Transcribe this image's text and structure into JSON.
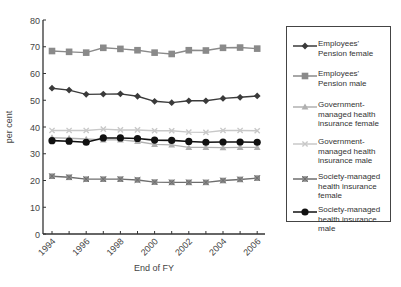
{
  "chart_data": {
    "type": "line",
    "title": "",
    "xlabel": "End of FY",
    "ylabel": "per cent",
    "ylim": [
      0,
      80
    ],
    "yticks": [
      0,
      10,
      20,
      30,
      40,
      50,
      60,
      70,
      80
    ],
    "x": [
      1994,
      1995,
      1996,
      1997,
      1998,
      1999,
      2000,
      2001,
      2002,
      2003,
      2004,
      2005,
      2006
    ],
    "xtick_labels": [
      "1994",
      "1996",
      "1998",
      "2000",
      "2002",
      "2004",
      "2006"
    ],
    "grid": false,
    "legend_position": "right",
    "series": [
      {
        "name": "Employees' Pension female",
        "marker": "diamond",
        "color": "#3a3a3a",
        "values": [
          54.5,
          53.8,
          52.2,
          52.3,
          52.4,
          51.5,
          49.6,
          49.1,
          49.8,
          49.8,
          50.7,
          51.1,
          51.6
        ]
      },
      {
        "name": "Employees' Pension male",
        "marker": "square",
        "color": "#8a8a8a",
        "values": [
          68.4,
          68.1,
          67.8,
          69.6,
          69.2,
          68.7,
          67.8,
          67.3,
          68.7,
          68.6,
          69.6,
          69.7,
          69.3
        ]
      },
      {
        "name": "Government-managed health insurance female",
        "marker": "triangle",
        "color": "#b0b0b0",
        "values": [
          36.0,
          35.8,
          35.5,
          35.2,
          35.2,
          34.6,
          33.5,
          33.3,
          32.4,
          32.4,
          32.3,
          32.4,
          32.4
        ]
      },
      {
        "name": "Government-managed health insurance male",
        "marker": "x",
        "color": "#c8c8c8",
        "values": [
          38.7,
          38.7,
          38.7,
          39.2,
          38.9,
          38.9,
          38.6,
          38.6,
          38.1,
          38.0,
          38.7,
          38.7,
          38.6
        ]
      },
      {
        "name": "Society-managed health insurance female",
        "marker": "x-square",
        "color": "#6e6e6e",
        "values": [
          21.6,
          21.2,
          20.5,
          20.5,
          20.5,
          20.2,
          19.4,
          19.3,
          19.3,
          19.3,
          20.0,
          20.4,
          20.9
        ]
      },
      {
        "name": "Society-managed health insurance male",
        "marker": "circle",
        "color": "#111111",
        "values": [
          34.9,
          34.7,
          34.3,
          35.9,
          35.9,
          35.7,
          35.1,
          35.0,
          34.6,
          34.3,
          34.4,
          34.4,
          34.3
        ]
      }
    ]
  },
  "legend": {
    "items": [
      {
        "label": "Employees' Pension female"
      },
      {
        "label": "Employees' Pension male"
      },
      {
        "label": "Government-managed health insurance female"
      },
      {
        "label": "Government-managed health insurance male"
      },
      {
        "label": "Society-managed health insurance female"
      },
      {
        "label": "Society-managed health insurance male"
      }
    ]
  }
}
